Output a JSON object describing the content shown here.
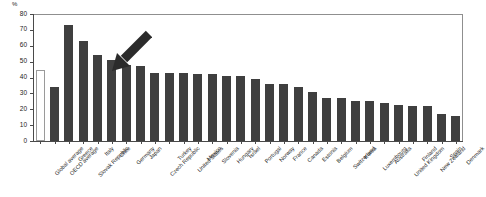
{
  "chart_data": {
    "type": "bar",
    "title": "",
    "subtitle": "",
    "xlabel": "",
    "ylabel": "%",
    "ylim": [
      0,
      80
    ],
    "yticks": [
      0,
      10,
      20,
      30,
      40,
      50,
      60,
      70,
      80
    ],
    "grid": false,
    "legend": "none",
    "categories": [
      "Global average",
      "OECD average",
      "Greece",
      "Slovak Republic",
      "Italy",
      "Chile",
      "Germany",
      "Japan",
      "Czech Republic",
      "Turkey",
      "United States",
      "Mexico",
      "Slovenia",
      "Hungary",
      "Israel",
      "Portugal",
      "Norway",
      "France",
      "Canada",
      "Estonia",
      "Belgium",
      "Switzerland",
      "Korea",
      "Luxembourg",
      "Australia",
      "United Kingdom",
      "Finland",
      "New Zealand",
      "Spain",
      "Denmark"
    ],
    "values": [
      45,
      34,
      73,
      63,
      54,
      51,
      48,
      47,
      43,
      43,
      43,
      42,
      42,
      41,
      41,
      39,
      36,
      36,
      34,
      31,
      27,
      27,
      25,
      25,
      24,
      23,
      22,
      22,
      17,
      16
    ],
    "highlight": {
      "category": "Japan",
      "annotation": "arrow",
      "direction": "down-left"
    },
    "series_style": {
      "bar_color": "#3f3f3f",
      "outlined_bars": [
        "Global average"
      ],
      "outline_color": "#9a9a9a",
      "outline_fill": "#ffffff"
    },
    "axis_color": "#4a4a4a",
    "plot_border_color": "#8f8f8f"
  }
}
